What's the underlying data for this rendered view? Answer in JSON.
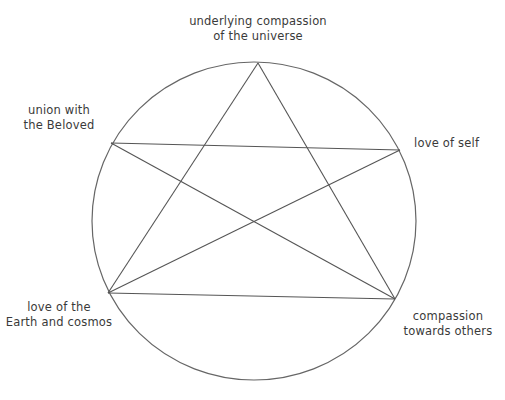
{
  "diagram": {
    "colors": {
      "background": "#ffffff",
      "stroke": "#555555",
      "text": "#3a3a3a"
    },
    "circle": {
      "cx": 254,
      "cy": 221,
      "rx": 162,
      "ry": 159
    },
    "nodes": [
      {
        "id": "top",
        "line1": "underlying compassion",
        "line2": "of the universe",
        "x": 258,
        "y": 63
      },
      {
        "id": "upper-left",
        "line1": "union with",
        "line2": "the Beloved",
        "x": 111,
        "y": 143
      },
      {
        "id": "upper-right",
        "line1": "love of self",
        "line2": "",
        "x": 400,
        "y": 150
      },
      {
        "id": "lower-left",
        "line1": "love of the",
        "line2": "Earth and cosmos",
        "x": 108,
        "y": 293
      },
      {
        "id": "lower-right",
        "line1": "compassion",
        "line2": "towards others",
        "x": 395,
        "y": 299
      }
    ],
    "edges": [
      [
        "top",
        "lower-left"
      ],
      [
        "top",
        "lower-right"
      ],
      [
        "upper-left",
        "upper-right"
      ],
      [
        "upper-left",
        "lower-right"
      ],
      [
        "upper-right",
        "lower-left"
      ],
      [
        "lower-left",
        "lower-right"
      ]
    ]
  }
}
